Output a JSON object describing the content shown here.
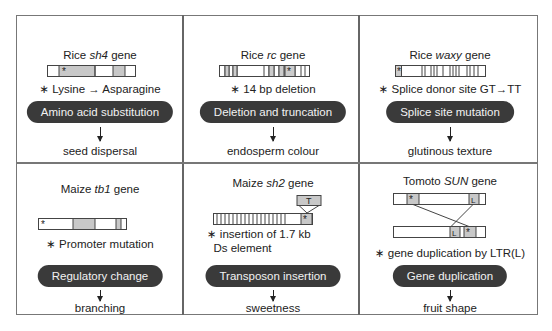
{
  "panels": [
    {
      "species_prefix": "Rice",
      "gene": "sh4",
      "suffix": "gene",
      "note_lines": [
        "Lysine → Asparagine"
      ],
      "mechanism": "Amino acid substitution",
      "trait": "seed dispersal"
    },
    {
      "species_prefix": "Rice",
      "gene": "rc",
      "suffix": "gene",
      "note_lines": [
        "14 bp deletion"
      ],
      "mechanism": "Deletion and truncation",
      "trait": "endosperm colour"
    },
    {
      "species_prefix": "Rice",
      "gene": "waxy",
      "suffix": "gene",
      "note_lines": [
        "Splice donor site GT→TT"
      ],
      "mechanism": "Splice site mutation",
      "trait": "glutinous texture"
    },
    {
      "species_prefix": "Maize",
      "gene": "tb1",
      "suffix": "gene",
      "note_lines": [
        "Promoter mutation"
      ],
      "mechanism": "Regulatory change",
      "trait": "branching"
    },
    {
      "species_prefix": "Maize",
      "gene": "sh2",
      "suffix": "gene",
      "note_lines": [
        "insertion of 1.7 kb",
        "Ds element"
      ],
      "mechanism": "Transposon insertion",
      "trait": "sweetness",
      "transposon_label": "T"
    },
    {
      "species_prefix": "Tomoto",
      "gene": "SUN",
      "suffix": "gene",
      "note_lines": [
        "gene duplication by LTR(L)"
      ],
      "mechanism": "Gene duplication",
      "trait": "fruit shape",
      "ltr_label": "L"
    }
  ],
  "mutation_marker": "∗",
  "colors": {
    "border": "#777777",
    "pill_bg": "#3a3a3a",
    "pill_text": "#f2f2f2",
    "exon_fill": "#c8c8c8",
    "text": "#222222"
  }
}
